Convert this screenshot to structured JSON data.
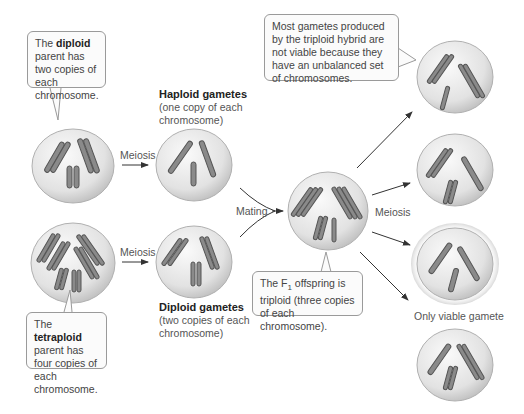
{
  "callouts": {
    "diploid": {
      "pre": "The ",
      "bold": "diploid",
      "post": " parent has two copies of each chromosome."
    },
    "tetraploid": {
      "pre": "The ",
      "bold": "tetraploid",
      "post": " parent has four copies of each chromosome."
    },
    "f1": {
      "pre": "The F",
      "sub": "1",
      "post": " offspring is triploid (three copies of each chromosome)."
    },
    "gametes_note": {
      "text": "Most gametes produced by the triploid hybrid are not viable because they have an unbalanced set of chromosomes."
    }
  },
  "labels": {
    "haploid_title": "Haploid gametes",
    "haploid_desc": "(one copy of each chromosome)",
    "diploid_title": "Diploid gametes",
    "diploid_desc": "(two copies of each chromosome)",
    "meiosis_top": "Meiosis",
    "meiosis_bottom": "Meiosis",
    "meiosis_right": "Meiosis",
    "mating": "Mating",
    "only_viable": "Only viable gamete"
  },
  "colors": {
    "cell_fill": "#e6e6e6",
    "cell_edge": "#b5b5b5",
    "chromosome": "#8a8a8a",
    "chromosome_edge": "#555555",
    "arrow": "#333333",
    "callout_border": "#9a9a9a"
  }
}
